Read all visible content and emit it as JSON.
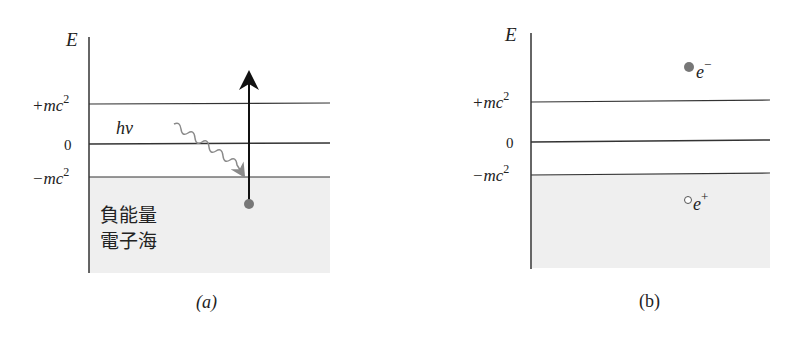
{
  "colors": {
    "line": "#333333",
    "sea_fill": "#efefef",
    "photon": "#8a8a8a",
    "particle": "#777777",
    "text": "#222222"
  },
  "panel_a": {
    "caption": "(a)",
    "axis_label": "E",
    "levels": [
      {
        "label_main": "+mc",
        "label_sup": "2",
        "name": "positive-rest-energy"
      },
      {
        "label_main": "0",
        "label_sup": "",
        "name": "zero-energy"
      },
      {
        "label_main": "−mc",
        "label_sup": "2",
        "name": "negative-rest-energy"
      }
    ],
    "photon_label": "hν",
    "sea_label_line1": "負能量",
    "sea_label_line2": "電子海"
  },
  "panel_b": {
    "caption": "(b)",
    "axis_label": "E",
    "levels": [
      {
        "label_main": "+mc",
        "label_sup": "2",
        "name": "positive-rest-energy"
      },
      {
        "label_main": "0",
        "label_sup": "",
        "name": "zero-energy"
      },
      {
        "label_main": "−mc",
        "label_sup": "2",
        "name": "negative-rest-energy"
      }
    ],
    "electron_label": "e",
    "electron_sup": "−",
    "positron_label": "e",
    "positron_sup": "+"
  }
}
